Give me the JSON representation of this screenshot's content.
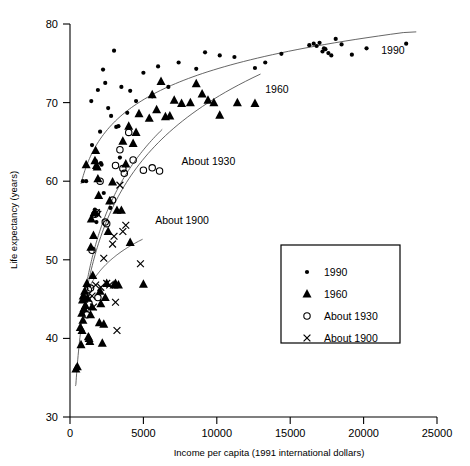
{
  "chart_data": {
    "type": "scatter",
    "title": "",
    "xlabel": "Income per capita (1991 international dollars)",
    "ylabel": "Life expectancy (years)",
    "xlim": [
      0,
      25000
    ],
    "ylim": [
      30,
      80
    ],
    "xticks": [
      0,
      5000,
      10000,
      15000,
      20000,
      25000
    ],
    "xtick_labels": [
      "0",
      "5000",
      "10000",
      "15000",
      "20000",
      "25000"
    ],
    "yticks": [
      30,
      40,
      50,
      60,
      70,
      80
    ],
    "ytick_labels": [
      "30",
      "40",
      "50",
      "60",
      "70",
      "80"
    ],
    "grid": false,
    "legend_position": "lower-right",
    "series": [
      {
        "name": "1990",
        "marker": "filled-circle",
        "color": "#000000",
        "points": [
          [
            880,
            60.0
          ],
          [
            1100,
            60.0
          ],
          [
            1450,
            70.2
          ],
          [
            1500,
            64.6
          ],
          [
            1700,
            56.4
          ],
          [
            1750,
            62.6
          ],
          [
            1800,
            54.8
          ],
          [
            1900,
            71.6
          ],
          [
            2050,
            66.3
          ],
          [
            2100,
            62.3
          ],
          [
            2150,
            62.1
          ],
          [
            2250,
            74.2
          ],
          [
            2300,
            58.5
          ],
          [
            2400,
            72.5
          ],
          [
            2600,
            69.3
          ],
          [
            2750,
            56.6
          ],
          [
            2800,
            68.3
          ],
          [
            3000,
            76.6
          ],
          [
            3150,
            66.9
          ],
          [
            3300,
            67.0
          ],
          [
            3400,
            63.0
          ],
          [
            3500,
            72.0
          ],
          [
            3900,
            68.7
          ],
          [
            4100,
            71.5
          ],
          [
            4500,
            70.2
          ],
          [
            5000,
            73.8
          ],
          [
            5600,
            70.8
          ],
          [
            6000,
            74.6
          ],
          [
            6700,
            72.0
          ],
          [
            7400,
            75.1
          ],
          [
            8600,
            74.3
          ],
          [
            9200,
            76.4
          ],
          [
            10200,
            76.0
          ],
          [
            11200,
            75.8
          ],
          [
            12600,
            74.4
          ],
          [
            13300,
            75.1
          ],
          [
            14400,
            76.2
          ],
          [
            16300,
            77.3
          ],
          [
            16600,
            77.5
          ],
          [
            16800,
            77.2
          ],
          [
            17000,
            77.6
          ],
          [
            17200,
            76.5
          ],
          [
            17300,
            76.9
          ],
          [
            17400,
            76.8
          ],
          [
            17600,
            76.3
          ],
          [
            17800,
            76.0
          ],
          [
            18100,
            78.1
          ],
          [
            18500,
            77.4
          ],
          [
            19200,
            76.1
          ],
          [
            20200,
            76.9
          ],
          [
            22900,
            77.5
          ]
        ]
      },
      {
        "name": "1960",
        "marker": "filled-triangle",
        "color": "#000000",
        "points": [
          [
            400,
            36.1
          ],
          [
            500,
            36.4
          ],
          [
            700,
            41.4
          ],
          [
            750,
            39.2
          ],
          [
            800,
            43.2
          ],
          [
            820,
            41.0
          ],
          [
            850,
            44.9
          ],
          [
            880,
            42.3
          ],
          [
            900,
            45.4
          ],
          [
            950,
            43.8
          ],
          [
            1000,
            46.0
          ],
          [
            1050,
            44.2
          ],
          [
            1100,
            62.1
          ],
          [
            1150,
            47.0
          ],
          [
            1200,
            45.1
          ],
          [
            1250,
            40.2
          ],
          [
            1300,
            40.0
          ],
          [
            1350,
            39.6
          ],
          [
            1400,
            43.0
          ],
          [
            1420,
            51.6
          ],
          [
            1450,
            55.2
          ],
          [
            1500,
            44.0
          ],
          [
            1550,
            48.0
          ],
          [
            1600,
            53.1
          ],
          [
            1650,
            56.0
          ],
          [
            1700,
            62.6
          ],
          [
            1750,
            63.9
          ],
          [
            1800,
            62.0
          ],
          [
            1850,
            61.8
          ],
          [
            1900,
            60.3
          ],
          [
            1950,
            58.2
          ],
          [
            2000,
            42.0
          ],
          [
            2050,
            46.0
          ],
          [
            2100,
            44.4
          ],
          [
            2200,
            39.4
          ],
          [
            2300,
            41.8
          ],
          [
            2400,
            45.2
          ],
          [
            2500,
            47.0
          ],
          [
            2600,
            53.6
          ],
          [
            2700,
            57.5
          ],
          [
            2900,
            59.9
          ],
          [
            3000,
            46.8
          ],
          [
            3100,
            47.0
          ],
          [
            3200,
            56.3
          ],
          [
            3300,
            46.8
          ],
          [
            3500,
            56.3
          ],
          [
            3600,
            65.1
          ],
          [
            3800,
            62.2
          ],
          [
            4000,
            67.0
          ],
          [
            4100,
            52.2
          ],
          [
            4300,
            64.8
          ],
          [
            4500,
            66.2
          ],
          [
            4700,
            68.6
          ],
          [
            5000,
            46.9
          ],
          [
            5400,
            68.0
          ],
          [
            5600,
            71.0
          ],
          [
            5900,
            69.1
          ],
          [
            6200,
            72.7
          ],
          [
            6500,
            68.2
          ],
          [
            6800,
            68.3
          ],
          [
            7100,
            70.3
          ],
          [
            7600,
            69.9
          ],
          [
            8200,
            70.0
          ],
          [
            8600,
            72.4
          ],
          [
            9000,
            71.1
          ],
          [
            9400,
            70.3
          ],
          [
            9800,
            70.0
          ],
          [
            10200,
            68.4
          ],
          [
            11400,
            70.0
          ],
          [
            12600,
            69.9
          ]
        ]
      },
      {
        "name": "About 1930",
        "marker": "open-circle",
        "color": "#000000",
        "points": [
          [
            1150,
            43.0
          ],
          [
            1250,
            46.2
          ],
          [
            1400,
            46.4
          ],
          [
            1500,
            51.2
          ],
          [
            1700,
            55.8
          ],
          [
            1800,
            56.0
          ],
          [
            1900,
            45.2
          ],
          [
            2050,
            60.0
          ],
          [
            2400,
            54.8
          ],
          [
            2500,
            54.6
          ],
          [
            2900,
            57.6
          ],
          [
            3100,
            62.0
          ],
          [
            3400,
            64.0
          ],
          [
            3600,
            61.6
          ],
          [
            3700,
            61.0
          ],
          [
            4000,
            66.2
          ],
          [
            4300,
            62.7
          ],
          [
            5000,
            61.4
          ],
          [
            5600,
            61.7
          ],
          [
            6100,
            61.3
          ]
        ]
      },
      {
        "name": "About 1900",
        "marker": "cross",
        "color": "#000000",
        "points": [
          [
            1000,
            45.0
          ],
          [
            1150,
            45.2
          ],
          [
            1300,
            45.0
          ],
          [
            1500,
            45.4
          ],
          [
            1600,
            44.0
          ],
          [
            1750,
            46.8
          ],
          [
            1800,
            56.0
          ],
          [
            1900,
            55.8
          ],
          [
            2100,
            46.5
          ],
          [
            2300,
            50.2
          ],
          [
            2500,
            47.0
          ],
          [
            2700,
            46.8
          ],
          [
            2900,
            52.0
          ],
          [
            3000,
            53.0
          ],
          [
            3100,
            44.6
          ],
          [
            3200,
            41.0
          ],
          [
            3400,
            59.5
          ],
          [
            3600,
            53.6
          ],
          [
            3800,
            54.4
          ],
          [
            4800,
            49.5
          ]
        ]
      }
    ],
    "trend_curves": [
      {
        "label": "1990",
        "series": "1990",
        "label_x": 21200,
        "label_y": 76.2
      },
      {
        "label": "1960",
        "series": "1960",
        "label_x": 13300,
        "label_y": 71.2
      },
      {
        "label": "About 1930",
        "series": "About 1930",
        "label_x": 7600,
        "label_y": 62.0
      },
      {
        "label": "About 1900",
        "series": "About 1900",
        "label_x": 5800,
        "label_y": 54.5
      }
    ]
  },
  "legend": {
    "entries": [
      {
        "label": "1990",
        "marker": "filled-circle"
      },
      {
        "label": "1960",
        "marker": "filled-triangle"
      },
      {
        "label": "About 1930",
        "marker": "open-circle"
      },
      {
        "label": "About 1900",
        "marker": "cross"
      }
    ]
  }
}
